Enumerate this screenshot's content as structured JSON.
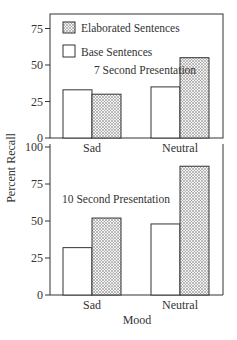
{
  "chart_data": [
    {
      "type": "bar",
      "title": "7 Second Presentation",
      "categories": [
        "Sad",
        "Neutral"
      ],
      "series": [
        {
          "name": "Base Sentences",
          "values": [
            33,
            35
          ]
        },
        {
          "name": "Elaborated Sentences",
          "values": [
            30,
            55
          ]
        }
      ],
      "yticks": [
        0,
        25,
        50,
        75
      ],
      "ylim": [
        0,
        85
      ],
      "xlabel": "",
      "ylabel": "Percent Recall",
      "legend": "top-left",
      "legend_entries": [
        "Elaborated Sentences",
        "Base Sentences"
      ],
      "grid": false
    },
    {
      "type": "bar",
      "title": "10 Second Presentation",
      "categories": [
        "Sad",
        "Neutral"
      ],
      "series": [
        {
          "name": "Base Sentences",
          "values": [
            32,
            48
          ]
        },
        {
          "name": "Elaborated Sentences",
          "values": [
            52,
            87
          ]
        }
      ],
      "yticks": [
        0,
        25,
        50,
        75,
        100
      ],
      "ylim": [
        0,
        100
      ],
      "xlabel": "Mood",
      "ylabel": "Percent Recall",
      "grid": false
    }
  ],
  "shared": {
    "ylabel": "Percent Recall",
    "xlabel": "Mood"
  }
}
